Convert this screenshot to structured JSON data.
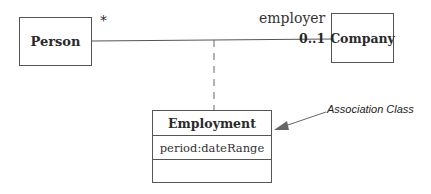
{
  "diagram": {
    "type": "UML class diagram",
    "classes": {
      "person": {
        "name": "Person"
      },
      "company": {
        "name": "Company"
      },
      "employment": {
        "name": "Employment",
        "attributes": [
          "period:dateRange"
        ],
        "operations": []
      }
    },
    "association": {
      "from": "Person",
      "to": "Company",
      "person_end_multiplicity": "*",
      "company_end_role": "employer",
      "company_end_multiplicity": "0..1",
      "association_class": "Employment"
    },
    "annotation": {
      "text": "Association Class",
      "points_to": "Employment"
    },
    "colors": {
      "line": "#555555",
      "text": "#2a2a2a",
      "background": "#ffffff"
    }
  }
}
